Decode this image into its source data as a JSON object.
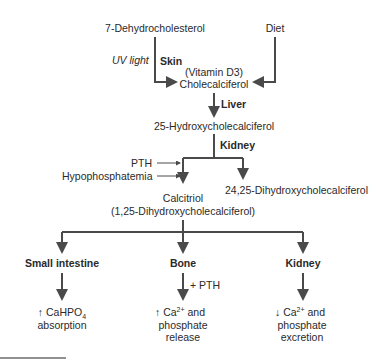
{
  "diagram": {
    "sources": {
      "precursor": "7-Dehydrocholesterol",
      "diet": "Diet"
    },
    "skin_step": {
      "condition": "UV light",
      "organ": "Skin"
    },
    "cholecalciferol": {
      "alias": "(Vitamin D3)",
      "name": "Cholecalciferol"
    },
    "liver_step": {
      "organ": "Liver"
    },
    "hydroxy": {
      "name": "25-Hydroxycholecalciferol"
    },
    "kidney_step": {
      "organ": "Kidney",
      "stimulators": [
        "PTH",
        "Hypophosphatemia"
      ]
    },
    "calcitriol": {
      "name": "Calcitriol",
      "alias": "(1,25-Dihydroxycholecalciferol)"
    },
    "alt_product": {
      "name": "24,25-Dihydroxycholecalciferol"
    },
    "targets": [
      {
        "organ": "Small intestine",
        "modifier": "",
        "effect_arrow": "↑",
        "effect_lines": [
          "CaHPO",
          "absorption"
        ],
        "subscript": "4"
      },
      {
        "organ": "Bone",
        "modifier": "+ PTH",
        "effect_arrow": "↑",
        "effect_lines": [
          "Ca",
          "phosphate",
          "release"
        ],
        "superscript": "2+",
        "suffix": " and"
      },
      {
        "organ": "Kidney",
        "modifier": "",
        "effect_arrow": "↓",
        "effect_lines": [
          "Ca",
          "phosphate",
          "excretion"
        ],
        "superscript": "2+",
        "suffix": " and"
      }
    ],
    "colors": {
      "line": "#4a4a4a",
      "text": "#2a2a2a"
    }
  }
}
